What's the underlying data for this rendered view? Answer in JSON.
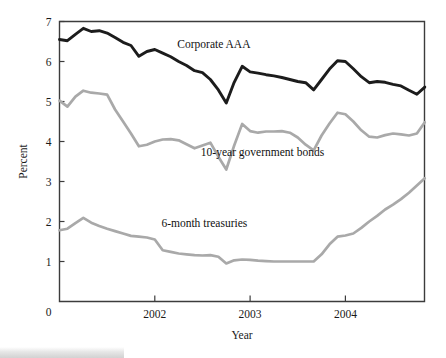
{
  "chart_data": {
    "type": "line",
    "title": "",
    "xlabel": "Year",
    "ylabel": "Percent",
    "xlim": [
      2001.0,
      2004.83
    ],
    "ylim": [
      0,
      7
    ],
    "grid": false,
    "legend_position": "inline-annotations",
    "x_tick_labels": [
      "2002",
      "2003",
      "2004"
    ],
    "x_tick_values": [
      2002,
      2003,
      2004
    ],
    "y_tick_labels": [
      "0",
      "1",
      "2",
      "3",
      "4",
      "5",
      "6",
      "7"
    ],
    "y_tick_values": [
      0,
      1,
      2,
      3,
      4,
      5,
      6,
      7
    ],
    "origin_label": "0",
    "series": [
      {
        "name": "Corporate AAA",
        "color": "#1c1c1c",
        "width": 2.9,
        "label_x": 2002.62,
        "label_y": 6.35,
        "x": [
          2001.0,
          2001.083,
          2001.167,
          2001.25,
          2001.333,
          2001.417,
          2001.5,
          2001.583,
          2001.667,
          2001.75,
          2001.833,
          2001.917,
          2002.0,
          2002.083,
          2002.167,
          2002.25,
          2002.333,
          2002.417,
          2002.5,
          2002.583,
          2002.667,
          2002.75,
          2002.833,
          2002.917,
          2003.0,
          2003.083,
          2003.167,
          2003.25,
          2003.333,
          2003.417,
          2003.5,
          2003.583,
          2003.667,
          2003.75,
          2003.833,
          2003.917,
          2004.0,
          2004.083,
          2004.167,
          2004.25,
          2004.333,
          2004.417,
          2004.5,
          2004.583,
          2004.667,
          2004.75,
          2004.833
        ],
        "values": [
          6.55,
          6.52,
          6.68,
          6.83,
          6.75,
          6.77,
          6.71,
          6.6,
          6.48,
          6.4,
          6.13,
          6.25,
          6.3,
          6.21,
          6.12,
          6.0,
          5.9,
          5.77,
          5.72,
          5.55,
          5.29,
          4.96,
          5.48,
          5.88,
          5.74,
          5.71,
          5.67,
          5.64,
          5.6,
          5.55,
          5.5,
          5.47,
          5.29,
          5.55,
          5.81,
          6.02,
          6.0,
          5.82,
          5.62,
          5.47,
          5.5,
          5.48,
          5.43,
          5.39,
          5.28,
          5.18,
          5.36
        ]
      },
      {
        "name": "10-year government bonds",
        "color": "#a9a9a9",
        "width": 2.7,
        "label_x": 2003.13,
        "label_y": 3.63,
        "x": [
          2001.0,
          2001.083,
          2001.167,
          2001.25,
          2001.333,
          2001.417,
          2001.5,
          2001.583,
          2001.667,
          2001.75,
          2001.833,
          2001.917,
          2002.0,
          2002.083,
          2002.167,
          2002.25,
          2002.333,
          2002.417,
          2002.5,
          2002.583,
          2002.667,
          2002.75,
          2002.833,
          2002.917,
          2003.0,
          2003.083,
          2003.167,
          2003.25,
          2003.333,
          2003.417,
          2003.5,
          2003.583,
          2003.667,
          2003.75,
          2003.833,
          2003.917,
          2004.0,
          2004.083,
          2004.167,
          2004.25,
          2004.333,
          2004.417,
          2004.5,
          2004.583,
          2004.667,
          2004.75,
          2004.833
        ],
        "values": [
          5.02,
          4.87,
          5.12,
          5.27,
          5.22,
          5.2,
          5.17,
          4.8,
          4.5,
          4.2,
          3.88,
          3.92,
          4.0,
          4.05,
          4.06,
          4.03,
          3.93,
          3.83,
          3.9,
          3.97,
          3.62,
          3.3,
          3.9,
          4.44,
          4.26,
          4.22,
          4.25,
          4.25,
          4.26,
          4.22,
          4.1,
          3.92,
          3.78,
          4.15,
          4.45,
          4.72,
          4.68,
          4.5,
          4.28,
          4.12,
          4.1,
          4.16,
          4.2,
          4.18,
          4.15,
          4.2,
          4.48
        ]
      },
      {
        "name": "6-month treasuries",
        "color": "#a9a9a9",
        "width": 2.7,
        "label_x": 2002.52,
        "label_y": 1.86,
        "x": [
          2001.0,
          2001.083,
          2001.167,
          2001.25,
          2001.333,
          2001.417,
          2001.5,
          2001.583,
          2001.667,
          2001.75,
          2001.833,
          2001.917,
          2002.0,
          2002.083,
          2002.167,
          2002.25,
          2002.333,
          2002.417,
          2002.5,
          2002.583,
          2002.667,
          2002.75,
          2002.833,
          2002.917,
          2003.0,
          2003.083,
          2003.167,
          2003.25,
          2003.333,
          2003.417,
          2003.5,
          2003.583,
          2003.667,
          2003.75,
          2003.833,
          2003.917,
          2004.0,
          2004.083,
          2004.167,
          2004.25,
          2004.333,
          2004.417,
          2004.5,
          2004.583,
          2004.667,
          2004.75,
          2004.833
        ],
        "values": [
          1.78,
          1.82,
          1.96,
          2.09,
          1.97,
          1.89,
          1.82,
          1.76,
          1.7,
          1.64,
          1.62,
          1.6,
          1.55,
          1.28,
          1.24,
          1.2,
          1.18,
          1.16,
          1.15,
          1.16,
          1.12,
          0.95,
          1.03,
          1.05,
          1.04,
          1.02,
          1.01,
          1.0,
          1.0,
          1.0,
          1.0,
          1.0,
          1.0,
          1.18,
          1.43,
          1.62,
          1.65,
          1.7,
          1.84,
          2.0,
          2.14,
          2.3,
          2.42,
          2.56,
          2.72,
          2.9,
          3.08
        ]
      }
    ]
  },
  "labels": {
    "corporate_aaa": "Corporate AAA",
    "ten_year": "10-year government bonds",
    "six_month": "6-month treasuries",
    "x_axis_title": "Year",
    "y_axis_title": "Percent"
  }
}
